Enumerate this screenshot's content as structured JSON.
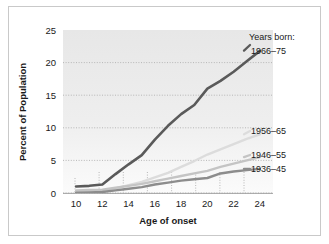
{
  "chart_data": {
    "type": "line",
    "title": "",
    "xlabel": "Age of onset",
    "ylabel": "Percent of Population",
    "xlim": [
      9,
      25
    ],
    "ylim": [
      0,
      25
    ],
    "xticks": [
      10,
      12,
      14,
      16,
      18,
      20,
      22,
      24
    ],
    "yticks": [
      0,
      5,
      10,
      15,
      20,
      25
    ],
    "grid": "horizontal-dotted-plus-vertical-dotted",
    "legend_position": "right-inline-end-labels",
    "legend_title": "Years born:",
    "x": [
      10,
      11,
      12,
      13,
      14,
      15,
      16,
      17,
      18,
      19,
      20,
      21,
      22,
      23,
      24
    ],
    "series": [
      {
        "name": "1966–75",
        "color": "#5a5a5a",
        "width": 2.6,
        "values": [
          1.0,
          1.1,
          1.3,
          2.9,
          4.4,
          5.8,
          8.2,
          10.3,
          12.1,
          13.5,
          16.0,
          17.2,
          18.6,
          20.2,
          21.8
        ]
      },
      {
        "name": "1956–65",
        "color": "#dcdcdc",
        "width": 2.4,
        "values": [
          0.2,
          0.25,
          0.3,
          0.7,
          1.2,
          1.7,
          2.4,
          3.1,
          4.0,
          4.9,
          5.9,
          6.7,
          7.5,
          8.3,
          9.0
        ]
      },
      {
        "name": "1946–55",
        "color": "#c4c4c4",
        "width": 2.4,
        "values": [
          0.4,
          0.45,
          0.5,
          0.8,
          1.1,
          1.4,
          1.8,
          2.2,
          2.6,
          3.0,
          3.4,
          4.0,
          4.5,
          5.0,
          5.5
        ]
      },
      {
        "name": "1936–45",
        "color": "#8c8c8c",
        "width": 2.4,
        "values": [
          0.05,
          0.1,
          0.15,
          0.4,
          0.65,
          0.9,
          1.3,
          1.6,
          1.9,
          2.1,
          2.3,
          3.0,
          3.3,
          3.5,
          3.7
        ]
      }
    ]
  },
  "axes": {
    "x_title": "Age of onset",
    "y_title": "Percent of Population",
    "x_tick_labels": [
      "10",
      "12",
      "14",
      "16",
      "18",
      "20",
      "22",
      "24"
    ],
    "y_tick_labels": [
      "0",
      "5",
      "10",
      "15",
      "20",
      "25"
    ]
  },
  "legend": {
    "title": "Years born:",
    "entries": [
      {
        "label": "1966–75"
      },
      {
        "label": "1956–65"
      },
      {
        "label": "1946–55"
      },
      {
        "label": "1936–45"
      }
    ]
  },
  "colors": {
    "plot_background": "#e9e9e9",
    "frame_border": "#c9c9c9",
    "gridline": "#b9b9b9",
    "text": "#1a1a1a"
  }
}
